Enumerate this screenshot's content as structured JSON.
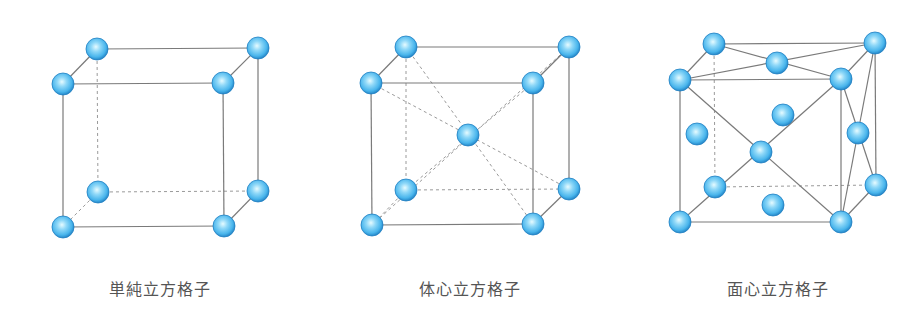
{
  "colors": {
    "edge": "#7a7a7a",
    "hidden_edge": "#9a9a9a",
    "sphere_highlight": "#e6fbff",
    "sphere_mid": "#5cc4f2",
    "sphere_edge": "#1f7fc2",
    "label": "#555555"
  },
  "sphere_radius": 11,
  "lattices": [
    {
      "id": "simple-cubic",
      "label": "単純立方格子",
      "label_x": 160,
      "atoms": [
        [
          97,
          49
        ],
        [
          258,
          48
        ],
        [
          63,
          84
        ],
        [
          223,
          83
        ],
        [
          98,
          192
        ],
        [
          258,
          191
        ],
        [
          63,
          227
        ],
        [
          224,
          226
        ]
      ],
      "solid_edges": [
        [
          [
            97,
            49
          ],
          [
            258,
            48
          ]
        ],
        [
          [
            63,
            84
          ],
          [
            223,
            83
          ]
        ],
        [
          [
            97,
            49
          ],
          [
            63,
            84
          ]
        ],
        [
          [
            258,
            48
          ],
          [
            223,
            83
          ]
        ],
        [
          [
            63,
            84
          ],
          [
            63,
            227
          ]
        ],
        [
          [
            223,
            83
          ],
          [
            224,
            226
          ]
        ],
        [
          [
            258,
            48
          ],
          [
            258,
            191
          ]
        ],
        [
          [
            63,
            227
          ],
          [
            224,
            226
          ]
        ],
        [
          [
            224,
            226
          ],
          [
            258,
            191
          ]
        ]
      ],
      "dashed_edges": [
        [
          [
            97,
            49
          ],
          [
            98,
            192
          ]
        ],
        [
          [
            98,
            192
          ],
          [
            258,
            191
          ]
        ],
        [
          [
            98,
            192
          ],
          [
            63,
            227
          ]
        ]
      ]
    },
    {
      "id": "body-centered-cubic",
      "label": "体心立方格子",
      "label_x": 470,
      "atoms": [
        [
          406,
          47
        ],
        [
          569,
          47
        ],
        [
          371,
          83
        ],
        [
          533,
          83
        ],
        [
          406,
          190
        ],
        [
          569,
          189
        ],
        [
          372,
          225
        ],
        [
          533,
          224
        ],
        [
          468,
          135
        ]
      ],
      "solid_edges": [
        [
          [
            406,
            47
          ],
          [
            569,
            47
          ]
        ],
        [
          [
            371,
            83
          ],
          [
            533,
            83
          ]
        ],
        [
          [
            406,
            47
          ],
          [
            371,
            83
          ]
        ],
        [
          [
            569,
            47
          ],
          [
            533,
            83
          ]
        ],
        [
          [
            371,
            83
          ],
          [
            372,
            225
          ]
        ],
        [
          [
            533,
            83
          ],
          [
            533,
            224
          ]
        ],
        [
          [
            569,
            47
          ],
          [
            569,
            189
          ]
        ],
        [
          [
            372,
            225
          ],
          [
            533,
            224
          ]
        ],
        [
          [
            533,
            224
          ],
          [
            569,
            189
          ]
        ]
      ],
      "dashed_edges": [
        [
          [
            406,
            47
          ],
          [
            406,
            190
          ]
        ],
        [
          [
            406,
            190
          ],
          [
            569,
            189
          ]
        ],
        [
          [
            406,
            190
          ],
          [
            372,
            225
          ]
        ],
        [
          [
            406,
            47
          ],
          [
            533,
            224
          ]
        ],
        [
          [
            569,
            47
          ],
          [
            372,
            225
          ]
        ],
        [
          [
            371,
            83
          ],
          [
            569,
            189
          ]
        ],
        [
          [
            533,
            83
          ],
          [
            406,
            190
          ]
        ]
      ]
    },
    {
      "id": "face-centered-cubic",
      "label": "面心立方格子",
      "label_x": 778,
      "atoms": [
        [
          714,
          44
        ],
        [
          875,
          43
        ],
        [
          680,
          80
        ],
        [
          841,
          79
        ],
        [
          715,
          187
        ],
        [
          876,
          185
        ],
        [
          680,
          222
        ],
        [
          841,
          222
        ],
        [
          777,
          63
        ],
        [
          783,
          115
        ],
        [
          697,
          134
        ],
        [
          858,
          133
        ],
        [
          761,
          152
        ],
        [
          773,
          205
        ]
      ],
      "solid_edges": [
        [
          [
            714,
            44
          ],
          [
            875,
            43
          ]
        ],
        [
          [
            680,
            80
          ],
          [
            841,
            79
          ]
        ],
        [
          [
            714,
            44
          ],
          [
            680,
            80
          ]
        ],
        [
          [
            875,
            43
          ],
          [
            841,
            79
          ]
        ],
        [
          [
            680,
            80
          ],
          [
            680,
            222
          ]
        ],
        [
          [
            841,
            79
          ],
          [
            841,
            222
          ]
        ],
        [
          [
            875,
            43
          ],
          [
            876,
            185
          ]
        ],
        [
          [
            680,
            222
          ],
          [
            841,
            222
          ]
        ],
        [
          [
            841,
            222
          ],
          [
            876,
            185
          ]
        ],
        [
          [
            714,
            44
          ],
          [
            841,
            79
          ]
        ],
        [
          [
            680,
            80
          ],
          [
            875,
            43
          ]
        ],
        [
          [
            680,
            80
          ],
          [
            841,
            222
          ]
        ],
        [
          [
            841,
            79
          ],
          [
            680,
            222
          ]
        ],
        [
          [
            841,
            79
          ],
          [
            876,
            185
          ]
        ],
        [
          [
            875,
            43
          ],
          [
            841,
            222
          ]
        ]
      ],
      "dashed_edges": [
        [
          [
            714,
            44
          ],
          [
            715,
            187
          ]
        ],
        [
          [
            715,
            187
          ],
          [
            876,
            185
          ]
        ]
      ]
    }
  ]
}
